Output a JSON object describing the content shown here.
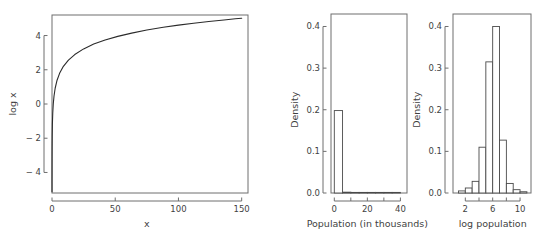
{
  "figure": {
    "background": "#ffffff",
    "line_color": "#2b2b2b",
    "axis_color": "#6e6e6e",
    "text_color": "#3f3f3f"
  },
  "chart_data": [
    {
      "id": "log-curve",
      "type": "line",
      "title": "",
      "xlabel": "x",
      "ylabel": "log x",
      "xlim": [
        0,
        155
      ],
      "ylim": [
        -5.2,
        5.2
      ],
      "xticks": [
        0,
        50,
        100,
        150
      ],
      "xticklabels": [
        "0",
        "50",
        "100",
        "150"
      ],
      "yticks": [
        -4,
        -2,
        0,
        2,
        4
      ],
      "yticklabels": [
        "− 4",
        "− 2",
        "0",
        "2",
        "4"
      ],
      "grid": false,
      "legend": "none",
      "series": [
        {
          "name": "log x",
          "x": [
            0.006,
            0.01,
            0.02,
            0.04,
            0.08,
            0.15,
            0.3,
            0.6,
            1,
            1.6,
            2.5,
            4,
            6,
            9,
            13,
            18,
            25,
            33,
            42,
            52,
            63,
            75,
            88,
            100,
            112,
            124,
            136,
            145,
            150
          ],
          "y": [
            -5.12,
            -4.61,
            -3.91,
            -3.22,
            -2.53,
            -1.9,
            -1.2,
            -0.51,
            0,
            0.47,
            0.92,
            1.39,
            1.79,
            2.2,
            2.56,
            2.89,
            3.22,
            3.5,
            3.74,
            3.95,
            4.14,
            4.32,
            4.48,
            4.61,
            4.72,
            4.82,
            4.91,
            4.98,
            5.01
          ]
        }
      ]
    },
    {
      "id": "population-hist",
      "type": "bar",
      "title": "",
      "xlabel": "Population (in thousands)",
      "ylabel": "Density",
      "xlim": [
        -2,
        44
      ],
      "ylim": [
        0,
        0.43
      ],
      "xticks": [
        0,
        10,
        20,
        30,
        40
      ],
      "xticklabels": [
        "0",
        "",
        "20",
        "",
        "40"
      ],
      "yticks": [
        0.0,
        0.1,
        0.2,
        0.3,
        0.4
      ],
      "yticklabels": [
        "0.0",
        "0.1",
        "0.2",
        "0.3",
        "0.4"
      ],
      "grid": false,
      "legend": "none",
      "bin_edges": [
        0,
        5,
        10,
        15,
        20,
        25,
        30,
        35,
        40
      ],
      "values": [
        0.198,
        0.002,
        0.0005,
        0.0003,
        0.0002,
        0.0001,
        0.0001,
        0.0001
      ]
    },
    {
      "id": "log-population-hist",
      "type": "bar",
      "title": "",
      "xlabel": "log population",
      "ylabel": "Density",
      "xlim": [
        0.2,
        11.6
      ],
      "ylim": [
        0,
        0.43
      ],
      "xticks": [
        2,
        4,
        6,
        8,
        10
      ],
      "xticklabels": [
        "2",
        "",
        "6",
        "",
        "10"
      ],
      "yticks": [
        0.0,
        0.1,
        0.2,
        0.3,
        0.4
      ],
      "yticklabels": [
        "0.0",
        "0.1",
        "0.2",
        "0.3",
        "0.4"
      ],
      "grid": false,
      "legend": "none",
      "bin_edges": [
        1,
        2,
        3,
        4,
        5,
        6,
        7,
        8,
        9,
        10,
        11
      ],
      "values": [
        0.005,
        0.012,
        0.028,
        0.11,
        0.315,
        0.4,
        0.127,
        0.023,
        0.008,
        0.003
      ]
    }
  ]
}
